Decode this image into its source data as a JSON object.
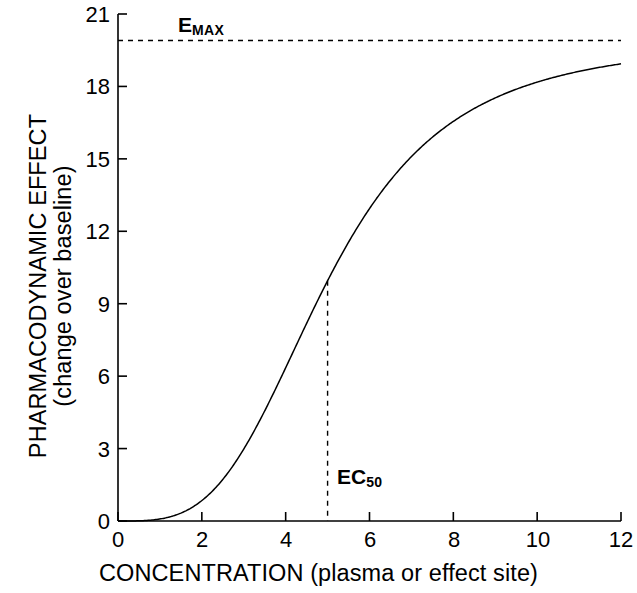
{
  "chart_data": {
    "type": "line",
    "title": "",
    "subtitle": "",
    "xlabel": "CONCENTRATION (plasma or effect site)",
    "ylabel_line1": "PHARMACODYNAMIC EFFECT",
    "ylabel_line2": "(change over baseline)",
    "xlim": [
      0,
      12
    ],
    "ylim": [
      0,
      21
    ],
    "xticks": [
      0,
      2,
      4,
      6,
      8,
      10,
      12
    ],
    "yticks": [
      0,
      3,
      6,
      9,
      12,
      15,
      18,
      21
    ],
    "xtick_labels": [
      "0",
      "2",
      "4",
      "6",
      "8",
      "10",
      "12"
    ],
    "ytick_labels": [
      "0",
      "3",
      "6",
      "9",
      "12",
      "15",
      "18",
      "21"
    ],
    "grid": false,
    "legend": "none",
    "line_color": "#000000",
    "model": "sigmoid Emax",
    "parameters": {
      "Emax": 19.9,
      "EC50": 5,
      "hill_coefficient": 3.4,
      "baseline": 0
    },
    "annotations": [
      {
        "name": "emax-asymptote",
        "text": "E",
        "subscript": "MAX",
        "style": "horizontal dashed line",
        "y_value": 19.9
      },
      {
        "name": "ec50-marker",
        "text": "EC",
        "subscript": "50",
        "style": "vertical dashed line",
        "x_value": 5,
        "y_value": 9.95
      }
    ],
    "series": [
      {
        "name": "effect",
        "x": [
          0,
          0.25,
          0.5,
          0.75,
          1,
          1.25,
          1.5,
          1.75,
          2,
          2.25,
          2.5,
          2.75,
          3,
          3.25,
          3.5,
          3.75,
          4,
          4.25,
          4.5,
          4.75,
          5,
          5.25,
          5.5,
          5.75,
          6,
          6.25,
          6.5,
          6.75,
          7,
          7.25,
          7.5,
          7.75,
          8,
          8.5,
          9,
          9.5,
          10,
          10.5,
          11,
          11.5,
          12
        ],
        "values": [
          0,
          0.01,
          0.04,
          0.12,
          0.26,
          0.48,
          0.79,
          1.21,
          1.76,
          2.43,
          3.23,
          4.15,
          5.17,
          6.28,
          7.45,
          8.65,
          9.84,
          11.0,
          12.1,
          13.1,
          14.0,
          14.8,
          15.5,
          16.1,
          16.7,
          17.1,
          17.5,
          17.8,
          18.1,
          18.3,
          18.5,
          18.7,
          18.9,
          19.1,
          19.3,
          19.4,
          19.5,
          19.6,
          19.6,
          19.7,
          19.7
        ]
      }
    ]
  },
  "axes": {
    "x_title": "CONCENTRATION (plasma or effect site)",
    "y_title_line1": "PHARMACODYNAMIC EFFECT",
    "y_title_line2": "(change over baseline)"
  },
  "labels": {
    "emax": "E",
    "emax_sub": "MAX",
    "ec50": "EC",
    "ec50_sub": "50"
  }
}
